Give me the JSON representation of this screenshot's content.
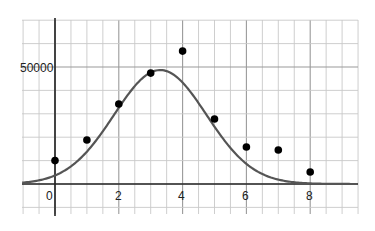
{
  "chart_data": {
    "type": "scatter",
    "title": "",
    "xlabel": "",
    "ylabel": "",
    "xlim": [
      -1,
      9.5
    ],
    "ylim": [
      -13000,
      70000
    ],
    "grid": true,
    "x_ticks": [
      0,
      2,
      4,
      6,
      8
    ],
    "x_tick_labels": [
      "0",
      "2",
      "4",
      "6",
      "8"
    ],
    "y_ticks": [
      50000
    ],
    "y_tick_labels": [
      "50000"
    ],
    "series": [
      {
        "name": "data points",
        "type": "scatter",
        "x": [
          0,
          1,
          2,
          3,
          4,
          5,
          6,
          7,
          8
        ],
        "y": [
          10000,
          18800,
          34200,
          47400,
          56800,
          27800,
          15800,
          14500,
          5100
        ],
        "color": "#000000"
      },
      {
        "name": "fitted curve",
        "type": "line",
        "model": "gaussian",
        "peak_x": 3.3,
        "peak_y": 48700,
        "sigma": 1.45,
        "x_range": [
          -1,
          9.5
        ],
        "color": "#555555"
      }
    ],
    "legend": null
  },
  "axes": {
    "x_labels": [
      "0",
      "2",
      "4",
      "6",
      "8"
    ],
    "y_label_50000": "50000"
  },
  "colors": {
    "grid": "#c8c8c8",
    "axis": "#222222",
    "curve": "#555555",
    "points": "#000000"
  }
}
